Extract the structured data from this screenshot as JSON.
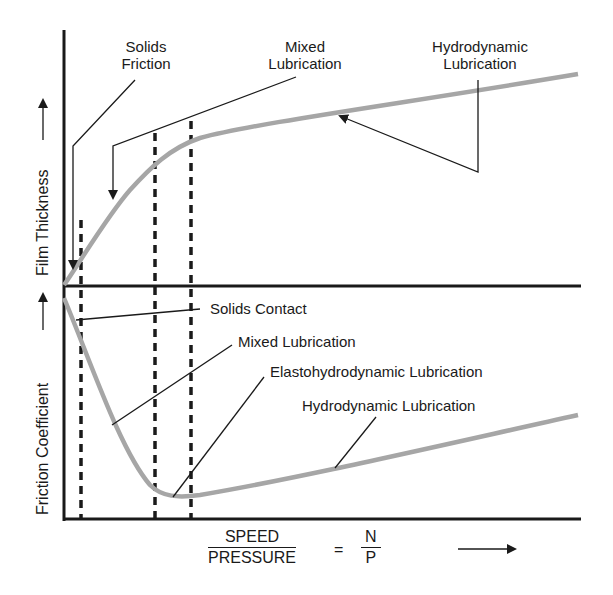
{
  "colors": {
    "curve": "#a6a6a6",
    "ink": "#1a1a1a",
    "background": "#ffffff"
  },
  "top_panel": {
    "y_axis_label": "Film Thickness →",
    "y_axis_text": "Film Thickness",
    "annotations": {
      "solids_friction": [
        "Solids",
        "Friction"
      ],
      "mixed_lubrication": [
        "Mixed",
        "Lubrication"
      ],
      "hydrodynamic_lubrication": [
        "Hydrodynamic",
        "Lubrication"
      ]
    }
  },
  "bottom_panel": {
    "y_axis_text": "Friction Coefficient",
    "annotations": {
      "solids_contact": "Solids Contact",
      "mixed_lubrication": "Mixed Lubrication",
      "elastohydrodynamic_lubrication": "Elastohydrodynamic Lubrication",
      "hydrodynamic_lubrication": "Hydrodynamic Lubrication"
    }
  },
  "x_axis": {
    "numerator": "SPEED",
    "denominator": "PRESSURE",
    "equals": "=",
    "rhs_numerator": "N",
    "rhs_denominator": "P"
  },
  "diagram": {
    "type": "stribeck-curve",
    "regime_boundaries_x_px": [
      81,
      155,
      191
    ],
    "film_thickness_curve_px": [
      [
        64,
        285
      ],
      [
        81,
        262
      ],
      [
        110,
        218
      ],
      [
        135,
        185
      ],
      [
        155,
        163
      ],
      [
        191,
        140
      ],
      [
        300,
        120
      ],
      [
        420,
        102
      ],
      [
        578,
        74
      ]
    ],
    "friction_curve_px": [
      [
        64,
        298
      ],
      [
        85,
        350
      ],
      [
        110,
        420
      ],
      [
        135,
        470
      ],
      [
        155,
        490
      ],
      [
        175,
        497
      ],
      [
        200,
        496
      ],
      [
        300,
        475
      ],
      [
        420,
        450
      ],
      [
        578,
        415
      ]
    ]
  }
}
